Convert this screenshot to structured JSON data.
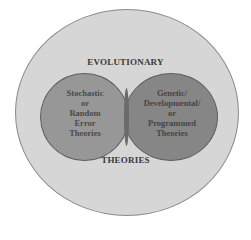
{
  "diagram": {
    "outer_circle": {
      "label_top": "EVOLUTIONARY",
      "label_bottom": "THEORIES",
      "fill": "#d6d6d6"
    },
    "left_circle": {
      "lines": [
        "Stochastic",
        "or",
        "Random",
        "Error",
        "Theories"
      ],
      "fill": "#8c8c8c"
    },
    "right_circle": {
      "lines": [
        "Genetic/",
        "Developmental/",
        "or",
        "Programmed",
        "Theories"
      ],
      "fill": "#787878"
    }
  }
}
